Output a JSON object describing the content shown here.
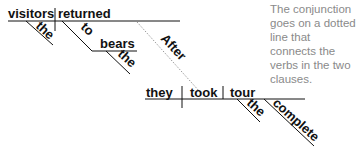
{
  "clause1": {
    "subject": "visitors",
    "verb": "returned",
    "subject_modifier": "the",
    "preposition": "to",
    "prep_object": "bears",
    "prep_object_modifier": "the"
  },
  "conjunction": "After",
  "clause2": {
    "subject": "they",
    "verb": "took",
    "object": "tour",
    "object_modifiers": [
      "the",
      "complete"
    ]
  },
  "annotation": "The conjunction goes on a dotted line that connects the verbs in the two clauses.",
  "colors": {
    "ink": "#111111",
    "annotation": "#8a8a8a",
    "dotted": "#9a9a9a"
  }
}
